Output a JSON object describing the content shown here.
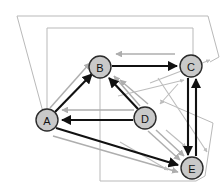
{
  "figure": {
    "kind": "directed-graph-diagram",
    "width": 224,
    "height": 190,
    "background_color": "#ffffff"
  },
  "palette": {
    "node_fill": "#c9c9c9",
    "node_stroke": "#2b2b2b",
    "edge_strong": "#111111",
    "edge_faded": "#aeaeae",
    "outline": "#b9b9b9",
    "label": "#111111"
  },
  "nodes": [
    {
      "id": "A",
      "label": "A",
      "x": 47,
      "y": 120,
      "r": 11
    },
    {
      "id": "B",
      "label": "B",
      "x": 100,
      "y": 67,
      "r": 11
    },
    {
      "id": "C",
      "label": "C",
      "x": 191,
      "y": 66,
      "r": 11
    },
    {
      "id": "D",
      "label": "D",
      "x": 145,
      "y": 118,
      "r": 11
    },
    {
      "id": "E",
      "label": "E",
      "x": 192,
      "y": 168,
      "r": 11
    }
  ],
  "edges_strong": [
    {
      "from": "A",
      "to": "B",
      "style": "black-arrow"
    },
    {
      "from": "B",
      "to": "C",
      "style": "black-arrow"
    },
    {
      "from": "D",
      "to": "B",
      "style": "black-arrow"
    },
    {
      "from": "D",
      "to": "A",
      "style": "black-arrow"
    },
    {
      "from": "A",
      "to": "E",
      "style": "black-arrow"
    },
    {
      "from": "C",
      "to": "E",
      "style": "black-arrow"
    },
    {
      "from": "E",
      "to": "C",
      "style": "black-arrow"
    }
  ],
  "edges_faded": [
    {
      "from": "A",
      "to": "B",
      "style": "gray-arrow"
    },
    {
      "from": "C",
      "to": "B",
      "style": "gray-arrow"
    },
    {
      "from": "D",
      "to": "B",
      "style": "gray-arrow"
    },
    {
      "from": "D",
      "to": "B",
      "style": "gray-arrow-2"
    },
    {
      "from": "D",
      "to": "A",
      "style": "gray-arrow"
    },
    {
      "from": "A",
      "to": "E",
      "style": "gray-arrow"
    },
    {
      "from": "D",
      "to": "E",
      "style": "gray-arrow"
    },
    {
      "from": "D",
      "to": "E",
      "style": "gray-arrow-2"
    },
    {
      "from": "E",
      "to": "C",
      "style": "gray-diagonal"
    },
    {
      "from": "C",
      "to": "E",
      "style": "gray-diagonal-2"
    },
    {
      "from": "C",
      "to": "D",
      "style": "gray-diagonal-3"
    },
    {
      "from": "A",
      "to": "C",
      "style": "gray-long"
    }
  ],
  "outlines": [
    {
      "name": "outer-trapezoid",
      "points": "17,16 208,16 219,57 27,113"
    },
    {
      "name": "inner-rectangle",
      "points": "47,27 193,27 193,118 47,118"
    },
    {
      "name": "lower-quad",
      "points": "100,66 213,123 196,181 100,181"
    }
  ],
  "caption": ""
}
